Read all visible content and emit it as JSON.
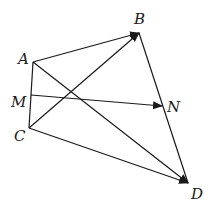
{
  "diagram": {
    "type": "vector-geometry",
    "points": {
      "A": {
        "label": "A",
        "x": 33,
        "y": 62,
        "lx": 18,
        "ly": 64
      },
      "B": {
        "label": "B",
        "x": 139,
        "y": 33,
        "lx": 134,
        "ly": 24
      },
      "M": {
        "label": "M",
        "x": 31,
        "y": 95,
        "lx": 11,
        "ly": 107
      },
      "N": {
        "label": "N",
        "x": 162,
        "y": 106,
        "lx": 167,
        "ly": 112
      },
      "C": {
        "label": "C",
        "x": 29,
        "y": 128,
        "lx": 14,
        "ly": 141
      },
      "D": {
        "label": "D",
        "x": 188,
        "y": 183,
        "lx": 191,
        "ly": 199
      }
    },
    "segments": [
      {
        "from": "A",
        "to": "C",
        "arrow": false
      },
      {
        "from": "B",
        "to": "D",
        "arrow": false
      }
    ],
    "vectors": [
      {
        "from": "A",
        "to": "B"
      },
      {
        "from": "C",
        "to": "B"
      },
      {
        "from": "A",
        "to": "D"
      },
      {
        "from": "C",
        "to": "D"
      },
      {
        "from": "M",
        "to": "N"
      }
    ],
    "stroke_color": "#1a1a1a"
  }
}
